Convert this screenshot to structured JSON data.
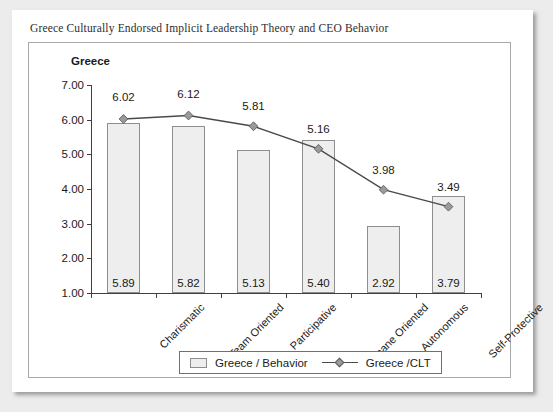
{
  "document": {
    "title": "Greece Culturally Endorsed Implicit Leadership Theory and CEO Behavior"
  },
  "chart_data": {
    "type": "bar",
    "title": "Greece",
    "xlabel": "",
    "ylabel": "",
    "ylim": [
      1.0,
      7.0
    ],
    "ytick_step": 1.0,
    "ytick_labels": [
      "1.00",
      "2.00",
      "3.00",
      "4.00",
      "5.00",
      "6.00",
      "7.00"
    ],
    "yticks": [
      1.0,
      2.0,
      3.0,
      4.0,
      5.0,
      6.0,
      7.0
    ],
    "grid": false,
    "legend_position": "bottom",
    "categories": [
      "Charismatic",
      "Team Oriented",
      "Participative",
      "Humane Oriented",
      "Autonomous",
      "Self-Protective"
    ],
    "series": [
      {
        "name": "Greece / Behavior",
        "type": "bar",
        "values": [
          5.89,
          5.82,
          5.13,
          5.4,
          2.92,
          3.79
        ],
        "labels": [
          "5.89",
          "5.82",
          "5.13",
          "5.40",
          "2.92",
          "3.79"
        ],
        "fill_color": "#eeeeee",
        "border_color": "#8e8e8e"
      },
      {
        "name": "Greece /CLT",
        "type": "line",
        "values": [
          6.02,
          6.12,
          5.81,
          5.16,
          3.98,
          3.49
        ],
        "labels": [
          "6.02",
          "6.12",
          "5.81",
          "5.16",
          "3.98",
          "3.49"
        ],
        "line_color": "#4a4a4a",
        "marker_color": "#9a9a9a",
        "marker": "diamond"
      }
    ]
  },
  "legend": {
    "entries": [
      {
        "label": "Greece / Behavior",
        "icon": "bar-swatch"
      },
      {
        "label": "Greece /CLT",
        "icon": "line-diamond-marker"
      }
    ]
  }
}
